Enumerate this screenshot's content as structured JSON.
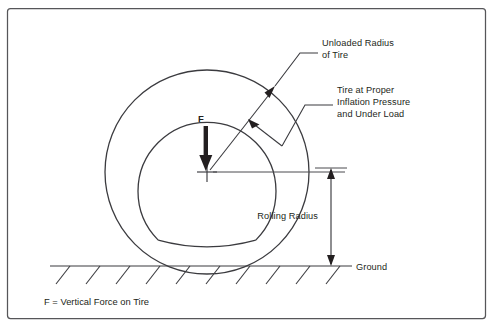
{
  "figure": {
    "background_color": "#ffffff",
    "line_color": "#3b3b3f",
    "text_color": "#231f20",
    "width": 494,
    "height": 327
  },
  "labels": {
    "unloaded_radius_line1": "Unloaded Radius",
    "unloaded_radius_line2": "of Tire",
    "inflation_line1": "Tire at Proper",
    "inflation_line2": "Inflation Pressure",
    "inflation_line3": "and Under Load",
    "rolling_radius": "Rolling Radius",
    "ground": "Ground",
    "force_symbol": "F",
    "caption": "F = Vertical Force on Tire"
  },
  "geometry": {
    "center_x": 207,
    "center_y": 172,
    "outer_radius": 102,
    "inner_radius": 69,
    "ground_y": 266,
    "ground_x_start": 50,
    "ground_x_end": 352,
    "dimension_x": 331,
    "frame_inset": 6
  },
  "icons": {
    "force_arrow": "down-arrow-icon",
    "center_mark": "crosshair-icon",
    "dimension_arrow": "double-arrow-vertical-icon",
    "leader_arrow": "leader-arrowhead-icon",
    "ground_hatch": "hatch-marks-icon"
  }
}
